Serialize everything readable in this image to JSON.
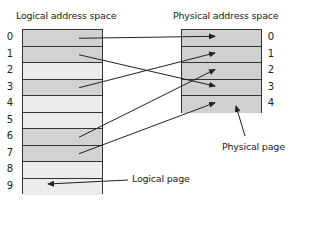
{
  "logical": {
    "title": "Logical address space",
    "rows": [
      {
        "label": "0",
        "shade": "dark"
      },
      {
        "label": "1",
        "shade": "dark"
      },
      {
        "label": "2",
        "shade": "light"
      },
      {
        "label": "3",
        "shade": "dark"
      },
      {
        "label": "4",
        "shade": "light"
      },
      {
        "label": "5",
        "shade": "light"
      },
      {
        "label": "6",
        "shade": "dark"
      },
      {
        "label": "7",
        "shade": "dark"
      },
      {
        "label": "8",
        "shade": "light"
      },
      {
        "label": "9",
        "shade": "light"
      }
    ]
  },
  "physical": {
    "title": "Physical address space",
    "rows": [
      {
        "label": "0"
      },
      {
        "label": "1"
      },
      {
        "label": "2"
      },
      {
        "label": "3"
      },
      {
        "label": "4"
      }
    ]
  },
  "mappings": [
    {
      "from": 0,
      "to": 0
    },
    {
      "from": 1,
      "to": 3
    },
    {
      "from": 3,
      "to": 1
    },
    {
      "from": 6,
      "to": 2
    },
    {
      "from": 7,
      "to": 4
    }
  ],
  "annotations": {
    "physical_page": "Physical page",
    "logical_page": "Logical page"
  },
  "colors": {
    "dark_cell": "#d2d2d2",
    "light_cell": "#ececec",
    "physical_cell": "#d0d0d0",
    "line": "#222222"
  }
}
